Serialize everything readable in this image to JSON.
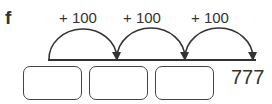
{
  "part_label": "f",
  "jumps": [
    {
      "label": "+ 100"
    },
    {
      "label": "+ 100"
    },
    {
      "label": "+ 100"
    }
  ],
  "boxes": [
    "",
    "",
    ""
  ],
  "end_value": "777"
}
